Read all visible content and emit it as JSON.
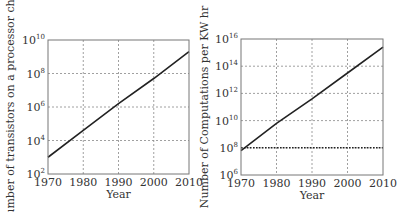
{
  "chart_data": [
    {
      "type": "line",
      "title": "",
      "xlabel": "Year",
      "ylabel": "Number of transistors on a processor chip",
      "yscale": "log",
      "xlim": [
        1970,
        2010
      ],
      "ylim_exp": [
        2,
        10
      ],
      "x_ticks": [
        "1970",
        "1980",
        "1990",
        "2000",
        "2010"
      ],
      "y_ticks": [
        {
          "base": "10",
          "exp": "2"
        },
        {
          "base": "10",
          "exp": "4"
        },
        {
          "base": "10",
          "exp": "6"
        },
        {
          "base": "10",
          "exp": "8"
        },
        {
          "base": "10",
          "exp": "10"
        }
      ],
      "grid": true,
      "series": [
        {
          "name": "transistors",
          "x": [
            1970,
            1980,
            1990,
            2000,
            2010
          ],
          "y_log10": [
            3.0,
            4.6,
            6.2,
            7.7,
            9.3
          ]
        }
      ]
    },
    {
      "type": "line",
      "title": "",
      "xlabel": "Year",
      "ylabel": "Number of Computations per KW hr",
      "yscale": "log",
      "xlim": [
        1970,
        2010
      ],
      "ylim_exp": [
        6,
        16
      ],
      "x_ticks": [
        "1970",
        "1980",
        "1990",
        "2000",
        "2010"
      ],
      "y_ticks": [
        {
          "base": "10",
          "exp": "6"
        },
        {
          "base": "10",
          "exp": "8"
        },
        {
          "base": "10",
          "exp": "10"
        },
        {
          "base": "10",
          "exp": "12"
        },
        {
          "base": "10",
          "exp": "14"
        },
        {
          "base": "10",
          "exp": "16"
        }
      ],
      "grid": true,
      "series": [
        {
          "name": "computations",
          "x": [
            1970,
            1980,
            1990,
            2000,
            2010
          ],
          "y_log10": [
            7.8,
            9.8,
            11.6,
            13.5,
            15.4
          ]
        },
        {
          "name": "reference-1e8",
          "style": "dotted",
          "x": [
            1970,
            2010
          ],
          "y_log10": [
            8,
            8
          ]
        }
      ]
    }
  ]
}
